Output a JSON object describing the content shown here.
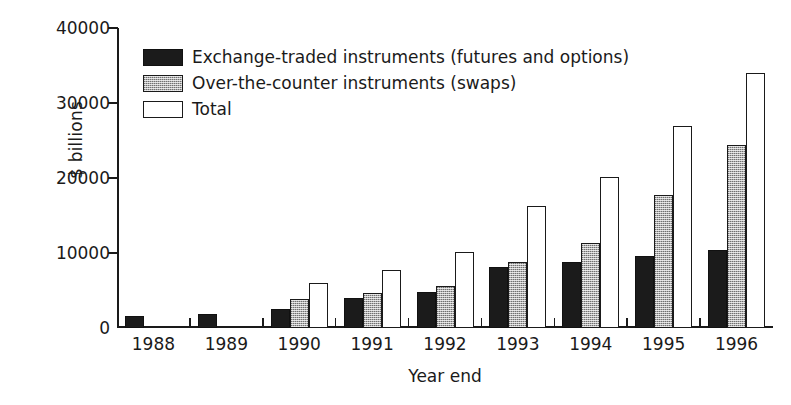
{
  "chart_data": {
    "type": "bar",
    "title": "",
    "subtitle": "",
    "xlabel": "Year end",
    "ylabel": "$ billions",
    "categories": [
      "1988",
      "1989",
      "1990",
      "1991",
      "1992",
      "1993",
      "1994",
      "1995",
      "1996"
    ],
    "series": [
      {
        "name": "Exchange-traded instruments (futures and options)",
        "color": "#1b1b1b",
        "fill": "solid-black",
        "values": [
          1600,
          1900,
          2500,
          4000,
          4800,
          8100,
          8800,
          9600,
          10400
        ]
      },
      {
        "name": "Over-the-counter instruments (swaps)",
        "color": "#b0b0b0",
        "fill": "stippled-grey",
        "values": [
          null,
          null,
          3900,
          4700,
          5600,
          8800,
          11400,
          17800,
          24400
        ]
      },
      {
        "name": "Total",
        "color": "#ffffff",
        "fill": "hollow-white",
        "values": [
          null,
          null,
          6000,
          7800,
          10100,
          16300,
          20100,
          26900,
          34000
        ]
      }
    ],
    "ylim": [
      0,
      40000
    ],
    "yticks": [
      0,
      10000,
      20000,
      30000,
      40000
    ],
    "ytick_labels": [
      "0",
      "10000",
      "20000",
      "30000",
      "40000"
    ],
    "grid": false,
    "legend_position": "upper-left-inside"
  },
  "legend": {
    "items": [
      {
        "label": "Exchange-traded instruments (futures and options)"
      },
      {
        "label": "Over-the-counter instruments (swaps)"
      },
      {
        "label": "Total"
      }
    ]
  },
  "axes": {
    "y_label": "$ billions",
    "x_label": "Year end"
  }
}
